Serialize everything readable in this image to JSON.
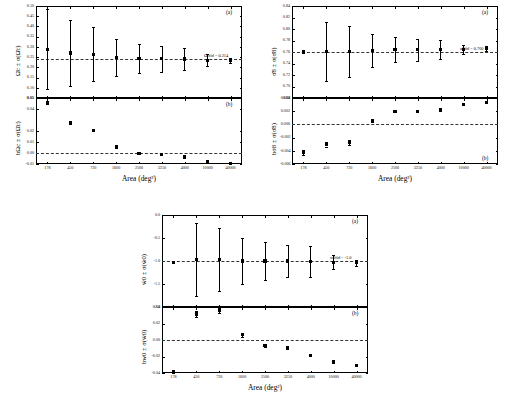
{
  "figure": {
    "shared_xlabel": "Area (deg²)",
    "x_categories": [
      "178",
      "450",
      "720",
      "1600",
      "2500",
      "3250",
      "4000",
      "10000",
      "40000"
    ]
  },
  "panels": {
    "omega_c": {
      "name": "Omega_c panel group",
      "top_label": "(a)",
      "bottom_label": "(b)",
      "top_ylabel": "Ω̂c ± σ(Ω̂c)",
      "bottom_ylabel": "bΩc ± σ(Ω̂c)",
      "annotation": "Ωcfid = 0.214",
      "top_yticks": [
        "0.50",
        "0.45",
        "0.40",
        "0.35",
        "0.30",
        "0.25",
        "0.20",
        "0.15",
        "0.10",
        "0.05"
      ],
      "bottom_yticks": [
        "0.05",
        "0.04",
        "0.02",
        "0.01",
        "0.00",
        "-0.01"
      ],
      "xlabel": "Area (deg²)"
    },
    "sigma_8": {
      "name": "sigma_8 panel group",
      "top_label": "(a)",
      "bottom_label": "(b)",
      "top_ylabel": "σ̂8 ± σ(σ̂8)",
      "bottom_ylabel": "bσ8 ± σ(σ̂8)",
      "annotation": "σ8fid = 0.760",
      "top_yticks": [
        "0.84",
        "0.82",
        "0.80",
        "0.78",
        "0.76",
        "0.74",
        "0.72",
        "0.70",
        "0.68"
      ],
      "bottom_yticks": [
        "0.004",
        "0.002",
        "0.000",
        "-0.002",
        "-0.004",
        "-0.006"
      ],
      "xlabel": "Area (deg²)"
    },
    "w_0": {
      "name": "w_0 panel group",
      "top_label": "(a)",
      "bottom_label": "(b)",
      "top_ylabel": "ŵ0 ± σ(ŵ0)",
      "bottom_ylabel": "bw0 ± σ(ŵ0)",
      "annotation": "w0fid = -1.0",
      "top_yticks": [
        "0.0",
        "-0.5",
        "-1.0",
        "-1.5",
        "-2.0"
      ],
      "bottom_yticks": [
        "0.04",
        "0.02",
        "0.00",
        "-0.02",
        "-0.04"
      ],
      "xlabel": "Area (deg²)"
    }
  },
  "chart_data": [
    {
      "type": "scatter",
      "id": "omega_c_estimate",
      "title": "",
      "panel": "(a)",
      "xlabel": "Area (deg²)",
      "ylabel": "Ω̂c ± σ(Ω̂c)",
      "categories": [
        "178",
        "450",
        "720",
        "1600",
        "2500",
        "3250",
        "4000",
        "10000",
        "40000"
      ],
      "values": [
        0.288,
        0.27,
        0.264,
        0.25,
        0.243,
        0.242,
        0.241,
        0.235,
        0.233
      ],
      "yerr": [
        0.196,
        0.16,
        0.133,
        0.091,
        0.073,
        0.063,
        0.055,
        0.028,
        0.013
      ],
      "ylim": [
        0.05,
        0.5
      ],
      "ytick_step": 0.05,
      "reference_line": 0.2424,
      "annotation": "Ωcfid = 0.214",
      "grid": false,
      "legend": "none"
    },
    {
      "type": "scatter",
      "id": "omega_c_bias",
      "panel": "(b)",
      "xlabel": "Area (deg²)",
      "ylabel": "bΩc ± σ(Ω̂c)",
      "categories": [
        "178",
        "450",
        "720",
        "1600",
        "2500",
        "3250",
        "4000",
        "10000",
        "40000"
      ],
      "values": [
        0.0455,
        0.0272,
        0.0207,
        0.0055,
        -0.0002,
        -0.0013,
        -0.0036,
        -0.0075,
        -0.0094
      ],
      "yerr": [
        0.0005,
        0.0005,
        0.0005,
        0.0005,
        0.0005,
        0.0005,
        0.0004,
        0.0004,
        0.0004
      ],
      "ylim": [
        -0.01,
        0.05
      ],
      "reference_line": 0.0,
      "grid": false,
      "legend": "none"
    },
    {
      "type": "scatter",
      "id": "sigma_8_estimate",
      "panel": "(a)",
      "xlabel": "Area (deg²)",
      "ylabel": "σ̂8 ± σ(σ̂8)",
      "categories": [
        "178",
        "450",
        "720",
        "1600",
        "2500",
        "3250",
        "4000",
        "10000",
        "40000"
      ],
      "values": [
        0.76,
        0.761,
        0.761,
        0.763,
        0.764,
        0.764,
        0.764,
        0.765,
        0.766
      ],
      "yerr": [
        0.0,
        0.051,
        0.045,
        0.029,
        0.022,
        0.019,
        0.017,
        0.008,
        0.004
      ],
      "ylim": [
        0.68,
        0.84
      ],
      "ytick_step": 0.02,
      "reference_line": 0.7605,
      "annotation": "σ8fid = 0.760",
      "grid": false,
      "legend": "none"
    },
    {
      "type": "scatter",
      "id": "sigma_8_bias",
      "panel": "(b)",
      "xlabel": "Area (deg²)",
      "ylabel": "bσ8 ± σ(σ̂8)",
      "categories": [
        "178",
        "450",
        "720",
        "1600",
        "2500",
        "3250",
        "4000",
        "10000",
        "40000"
      ],
      "values": [
        -0.0043,
        -0.003,
        -0.0027,
        0.00055,
        0.002,
        0.00195,
        0.00222,
        0.00298,
        0.0033
      ],
      "yerr": [
        0.00035,
        0.00035,
        0.00035,
        0.00025,
        0.00018,
        0.00013,
        0.00012,
        8e-05,
        6e-05
      ],
      "ylim": [
        -0.006,
        0.004
      ],
      "reference_line": 0.0,
      "grid": false,
      "legend": "none"
    },
    {
      "type": "scatter",
      "id": "w_0_estimate",
      "panel": "(a)",
      "xlabel": "Area (deg²)",
      "ylabel": "ŵ0 ± σ(ŵ0)",
      "categories": [
        "178",
        "450",
        "720",
        "1600",
        "2500",
        "3250",
        "4000",
        "10000",
        "40000"
      ],
      "values": [
        -1.03,
        -0.97,
        -0.97,
        -1.0,
        -1.0,
        -1.0,
        -1.01,
        -1.03,
        -1.04
      ],
      "yerr": [
        0.0,
        0.8,
        0.68,
        0.49,
        0.41,
        0.35,
        0.33,
        0.15,
        0.07
      ],
      "ylim": [
        -2.0,
        0.0
      ],
      "ytick_step": 0.5,
      "reference_line": -1.0,
      "annotation": "w0fid = -1.0",
      "grid": false,
      "legend": "none"
    },
    {
      "type": "scatter",
      "id": "w_0_bias",
      "panel": "(b)",
      "xlabel": "Area (deg²)",
      "ylabel": "bw0 ± σ(ŵ0)",
      "categories": [
        "178",
        "450",
        "720",
        "1600",
        "2500",
        "3250",
        "4000",
        "10000",
        "40000"
      ],
      "values": [
        -0.0395,
        0.0315,
        0.0355,
        0.0063,
        -0.0065,
        -0.0095,
        -0.0185,
        -0.0265,
        -0.0305
      ],
      "yerr": [
        0.0035,
        0.0035,
        0.0032,
        0.0022,
        0.0018,
        0.0016,
        0.0014,
        0.0008,
        0.0006
      ],
      "ylim": [
        -0.04,
        0.04
      ],
      "reference_line": 0.0,
      "grid": false,
      "legend": "none"
    }
  ]
}
